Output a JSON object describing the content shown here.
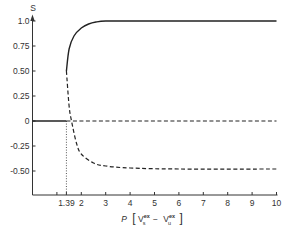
{
  "chart_data": {
    "type": "line",
    "title": "",
    "xlabel": "P [V_s^ex − V_u^ex]",
    "ylabel": "S",
    "xlim": [
      0,
      10
    ],
    "ylim": [
      -0.5,
      1.0
    ],
    "grid": false,
    "legend": null,
    "x_ticks": [
      1,
      1.39,
      2,
      3,
      4,
      5,
      6,
      7,
      8,
      9,
      10
    ],
    "x_tick_labels": [
      "",
      "1.39",
      "2",
      "3",
      "4",
      "5",
      "6",
      "7",
      "8",
      "9",
      "10"
    ],
    "y_ticks": [
      1.0,
      0.75,
      0.5,
      0.25,
      0,
      -0.25,
      -0.5
    ],
    "y_tick_labels": [
      "1.0",
      "0.75",
      "0.50",
      "0.25",
      "0",
      "-0.25",
      "-0.50"
    ],
    "annotations": [
      {
        "type": "vertical-dotted-line",
        "x": 1.39,
        "from_y": 0,
        "to_y": "axis",
        "label": "1.39"
      }
    ],
    "series": [
      {
        "name": "disordered (S=0) stable",
        "style": "solid",
        "x": [
          0,
          1.39
        ],
        "y": [
          0,
          0
        ]
      },
      {
        "name": "disordered (S=0) unstable",
        "style": "dashed",
        "x": [
          1.39,
          10
        ],
        "y": [
          0,
          0
        ]
      },
      {
        "name": "ordered stable branch",
        "style": "solid",
        "x": [
          1.39,
          1.5,
          1.7,
          2.0,
          2.3,
          2.6,
          3.0,
          4.0,
          6.0,
          10.0
        ],
        "y": [
          0.5,
          0.72,
          0.85,
          0.93,
          0.97,
          0.99,
          1.0,
          1.0,
          1.0,
          1.0
        ]
      },
      {
        "name": "ordered unstable branch",
        "style": "dashed",
        "x": [
          1.39,
          1.5,
          1.6,
          1.8,
          2.0,
          2.5,
          3.0,
          4.0,
          6.0,
          10.0
        ],
        "y": [
          0.5,
          0.15,
          0.0,
          -0.22,
          -0.33,
          -0.42,
          -0.45,
          -0.47,
          -0.48,
          -0.48
        ]
      }
    ]
  },
  "axis": {
    "y_title": "S",
    "x_title_prefix": "P",
    "x_title_v1": "V",
    "x_title_v1_sup": "ex",
    "x_title_v1_sub": "s",
    "x_title_minus": "−",
    "x_title_v2": "V",
    "x_title_v2_sup": "ex",
    "x_title_v2_sub": "u"
  }
}
